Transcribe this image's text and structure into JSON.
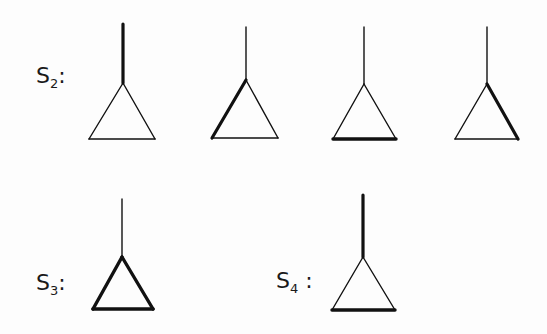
{
  "rows": [
    {
      "label": "S",
      "subscript": "2",
      "suffix": ":",
      "figures": [
        {
          "id": "s2-a",
          "bold_edge": "stem"
        },
        {
          "id": "s2-b",
          "bold_edge": "left-side"
        },
        {
          "id": "s2-c",
          "bold_edge": "base"
        },
        {
          "id": "s2-d",
          "bold_edge": "right-side"
        }
      ]
    },
    {
      "label": "S",
      "subscript": "3",
      "suffix": ":",
      "figures": [
        {
          "id": "s3-a",
          "bold_edge": "all-triangle-sides"
        }
      ]
    },
    {
      "label": "S",
      "subscript": "4",
      "suffix": " :",
      "figures": [
        {
          "id": "s4-a",
          "bold_edge": "stem-and-base"
        }
      ]
    }
  ],
  "colors": {
    "line": "#111111",
    "background": "#fdfdfd"
  }
}
